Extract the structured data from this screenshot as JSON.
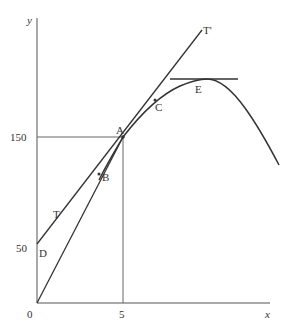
{
  "diagram": {
    "axes": {
      "x_label": "x",
      "y_label": "y",
      "x_ticks": [
        {
          "value": "0",
          "label": "0"
        },
        {
          "value": "5",
          "label": "5"
        }
      ],
      "y_ticks": [
        {
          "value": "50",
          "label": "50"
        },
        {
          "value": "150",
          "label": "150"
        }
      ]
    },
    "points": {
      "A": "A",
      "B": "B",
      "C": "C",
      "D": "D",
      "E": "E"
    },
    "lines": {
      "tangent_start_label": "T",
      "tangent_end_label": "T'"
    },
    "colors": {
      "stroke": "#333333",
      "axis": "#555555",
      "background": "#ffffff"
    }
  }
}
